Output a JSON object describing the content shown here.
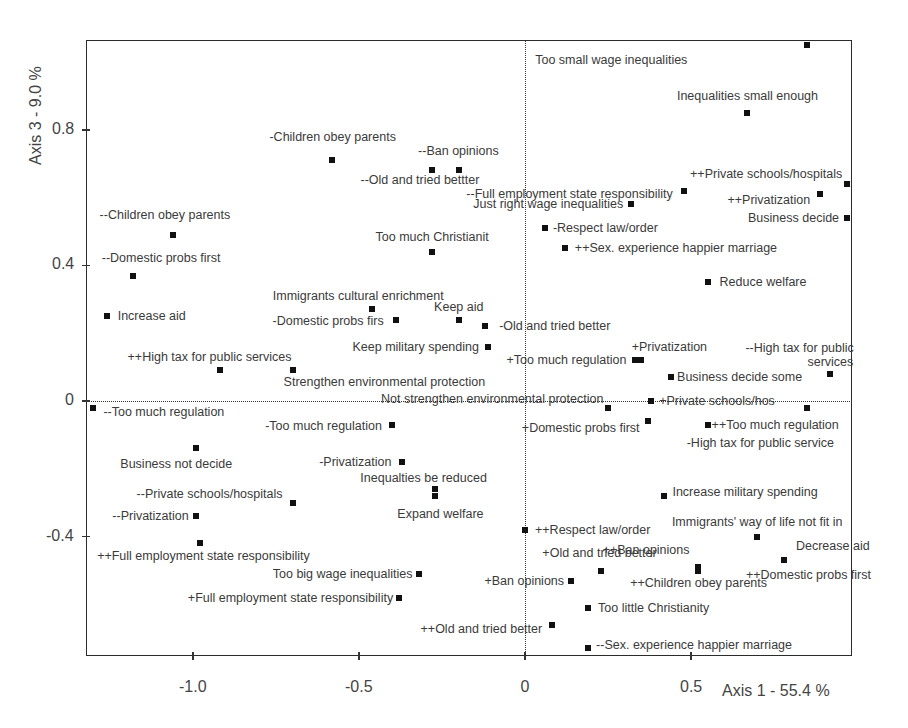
{
  "chart_data": {
    "type": "scatter",
    "title": "",
    "xlabel": "Axis 1  -  55.4 %",
    "ylabel": "Axis 3  -  9.0 %",
    "xlim": [
      -1.31,
      0.99
    ],
    "ylim": [
      -0.75,
      1.07
    ],
    "xticks": [
      -1.0,
      -0.5,
      0,
      0.5
    ],
    "xtick_labels": [
      "-1.0",
      "-0.5",
      "0",
      "0.5"
    ],
    "yticks": [
      -0.4,
      0,
      0.4,
      0.8
    ],
    "ytick_labels": [
      "-0.4",
      "0",
      "0.4",
      "0.8"
    ],
    "grid": false,
    "reference_lines": {
      "x": 0,
      "y": 0,
      "style": "dotted"
    },
    "marker": "square",
    "legend": null,
    "points": [
      {
        "label": "Too small wage inequalities",
        "x": 0.85,
        "y": 1.05,
        "lx": -120,
        "ly": 8,
        "anchor": "right"
      },
      {
        "label": "Inequalities small enough",
        "x": 0.67,
        "y": 0.85,
        "lx": 0,
        "ly": -24,
        "anchor": "center"
      },
      {
        "label": "-Children obey parents",
        "x": -0.58,
        "y": 0.71,
        "lx": 0,
        "ly": -30,
        "anchor": "center"
      },
      {
        "label": "--Old and tried bettter",
        "x": -0.28,
        "y": 0.68,
        "lx": -12,
        "ly": 3,
        "anchor": "center"
      },
      {
        "label": "--Ban opinions",
        "x": -0.2,
        "y": 0.68,
        "lx": 0,
        "ly": -26,
        "anchor": "center"
      },
      {
        "label": "--Full employment state responsibility",
        "x": 0.48,
        "y": 0.62,
        "lx": -12,
        "ly": -4,
        "anchor": "right"
      },
      {
        "label": "++Private schools/hospitals",
        "x": 0.97,
        "y": 0.64,
        "lx": -5,
        "ly": -17,
        "anchor": "right"
      },
      {
        "label": "++Privatization",
        "x": 0.89,
        "y": 0.61,
        "lx": -10,
        "ly": -1,
        "anchor": "right"
      },
      {
        "label": "Just right wage inequalities",
        "x": 0.32,
        "y": 0.58,
        "lx": -8,
        "ly": -7,
        "anchor": "right"
      },
      {
        "label": "Business decide",
        "x": 0.97,
        "y": 0.54,
        "lx": -8,
        "ly": -7,
        "anchor": "right"
      },
      {
        "label": "-Respect law/order",
        "x": 0.06,
        "y": 0.51,
        "lx": 8,
        "ly": -7,
        "anchor": "left"
      },
      {
        "label": "--Children obey parents",
        "x": -1.06,
        "y": 0.49,
        "lx": -8,
        "ly": -27,
        "anchor": "center"
      },
      {
        "label": "++Sex. experience happier marriage",
        "x": 0.12,
        "y": 0.45,
        "lx": 10,
        "ly": -7,
        "anchor": "left"
      },
      {
        "label": "Too much Christianit",
        "x": -0.28,
        "y": 0.44,
        "lx": 0,
        "ly": -22,
        "anchor": "center"
      },
      {
        "label": "--Domestic probs first",
        "x": -1.18,
        "y": 0.37,
        "lx": 28,
        "ly": -25,
        "anchor": "center"
      },
      {
        "label": "Reduce welfare",
        "x": 0.55,
        "y": 0.35,
        "lx": 12,
        "ly": -7,
        "anchor": "left"
      },
      {
        "label": "Increase aid",
        "x": -1.26,
        "y": 0.25,
        "lx": 11,
        "ly": -7,
        "anchor": "left"
      },
      {
        "label": "Immigrants cultural enrichment",
        "x": -0.46,
        "y": 0.27,
        "lx": -14,
        "ly": -20,
        "anchor": "center"
      },
      {
        "label": "-Domestic probs firs",
        "x": -0.39,
        "y": 0.24,
        "lx": -12,
        "ly": -6,
        "anchor": "right"
      },
      {
        "label": "Keep aid",
        "x": -0.2,
        "y": 0.24,
        "lx": 0,
        "ly": -20,
        "anchor": "center"
      },
      {
        "label": "-Old and tried better",
        "x": -0.12,
        "y": 0.22,
        "lx": 14,
        "ly": -7,
        "anchor": "left"
      },
      {
        "label": "Keep military spending",
        "x": -0.11,
        "y": 0.16,
        "lx": -10,
        "ly": -7,
        "anchor": "right"
      },
      {
        "label": "++High tax for public services",
        "x": -0.92,
        "y": 0.09,
        "lx": -10,
        "ly": -20,
        "anchor": "center"
      },
      {
        "label": "Strengthen environmental protection",
        "x": -0.7,
        "y": 0.09,
        "lx": 92,
        "ly": 5,
        "anchor": "center"
      },
      {
        "label": "+Too much regulation",
        "x": 0.33,
        "y": 0.12,
        "lx": -8,
        "ly": -7,
        "anchor": "right"
      },
      {
        "label": "+Privatization",
        "x": 0.35,
        "y": 0.12,
        "lx": 28,
        "ly": -20,
        "anchor": "center"
      },
      {
        "label": "Business decide some",
        "x": 0.44,
        "y": 0.07,
        "lx": 6,
        "ly": -7,
        "anchor": "left"
      },
      {
        "label": "--High tax for public",
        "x": 0.92,
        "y": 0.08,
        "lx": 23,
        "ly": -33,
        "anchor": "right"
      },
      {
        "label": "services",
        "x": 0.92,
        "y": 0.08,
        "lx": 23,
        "ly": -19,
        "anchor": "right",
        "no_marker": true
      },
      {
        "label": "Not strengthen environmental protection",
        "x": 0.25,
        "y": -0.02,
        "lx": -5,
        "ly": -16,
        "anchor": "right"
      },
      {
        "label": "+Private schools/hos",
        "x": 0.38,
        "y": 0.0,
        "lx": 8,
        "ly": -7,
        "anchor": "left"
      },
      {
        "label": "-High tax for public service",
        "x": 0.85,
        "y": -0.02,
        "lx": -47,
        "ly": 28,
        "anchor": "center"
      },
      {
        "label": "--Too much regulation",
        "x": -1.3,
        "y": -0.02,
        "lx": 10,
        "ly": -3,
        "anchor": "left"
      },
      {
        "label": "+Domestic probs first",
        "x": 0.37,
        "y": -0.06,
        "lx": -8,
        "ly": 0,
        "anchor": "right"
      },
      {
        "label": "++Too much regulation",
        "x": 0.55,
        "y": -0.07,
        "lx": 4,
        "ly": -7,
        "anchor": "left"
      },
      {
        "label": "-Too much regulation",
        "x": -0.4,
        "y": -0.07,
        "lx": -10,
        "ly": -6,
        "anchor": "right"
      },
      {
        "label": "Business not decide",
        "x": -0.99,
        "y": -0.14,
        "lx": -20,
        "ly": 9,
        "anchor": "center"
      },
      {
        "label": "-Privatization",
        "x": -0.37,
        "y": -0.18,
        "lx": -11,
        "ly": -7,
        "anchor": "right"
      },
      {
        "label": "Inequalties be reduced",
        "x": -0.27,
        "y": -0.26,
        "lx": -12,
        "ly": -18,
        "anchor": "center"
      },
      {
        "label": "Expand welfare",
        "x": -0.27,
        "y": -0.28,
        "lx": 5,
        "ly": 11,
        "anchor": "center"
      },
      {
        "label": "Increase military spending",
        "x": 0.42,
        "y": -0.28,
        "lx": 8,
        "ly": -11,
        "anchor": "left"
      },
      {
        "label": "--Private schools/hospitals",
        "x": -0.7,
        "y": -0.3,
        "lx": -10,
        "ly": -16,
        "anchor": "right"
      },
      {
        "label": "--Privatization",
        "x": -0.99,
        "y": -0.34,
        "lx": -8,
        "ly": -7,
        "anchor": "right"
      },
      {
        "label": "++Respect law/order",
        "x": 0.0,
        "y": -0.38,
        "lx": 10,
        "ly": -7,
        "anchor": "left"
      },
      {
        "label": "Immigrants' way of life not fit in",
        "x": 0.7,
        "y": -0.4,
        "lx": 0,
        "ly": -22,
        "anchor": "center"
      },
      {
        "label": "++Full employment state responsibility",
        "x": -0.98,
        "y": -0.42,
        "lx": 4,
        "ly": 6,
        "anchor": "center"
      },
      {
        "label": "Decrease aid",
        "x": 0.78,
        "y": -0.47,
        "lx": 12,
        "ly": -21,
        "anchor": "left"
      },
      {
        "label": "++Domestic probs first",
        "x": 0.78,
        "y": -0.47,
        "lx": -38,
        "ly": 8,
        "anchor": "left"
      },
      {
        "label": "++Ban opinions",
        "x": 0.52,
        "y": -0.49,
        "lx": -8,
        "ly": -24,
        "anchor": "right"
      },
      {
        "label": "++Children obey parents",
        "x": 0.52,
        "y": -0.5,
        "lx": 1,
        "ly": 5,
        "anchor": "center"
      },
      {
        "label": "+Old and tried better",
        "x": 0.23,
        "y": -0.5,
        "lx": -2,
        "ly": -25,
        "anchor": "center"
      },
      {
        "label": "Too big wage inequalities",
        "x": -0.32,
        "y": -0.51,
        "lx": -6,
        "ly": -7,
        "anchor": "right"
      },
      {
        "label": "+Ban opinions",
        "x": 0.14,
        "y": -0.53,
        "lx": -7,
        "ly": -7,
        "anchor": "right"
      },
      {
        "label": "+Full employment state responsibility",
        "x": -0.38,
        "y": -0.58,
        "lx": -6,
        "ly": -7,
        "anchor": "right"
      },
      {
        "label": "Too little Christianity",
        "x": 0.19,
        "y": -0.61,
        "lx": 10,
        "ly": -7,
        "anchor": "left"
      },
      {
        "label": "++Old and tried better",
        "x": 0.08,
        "y": -0.66,
        "lx": -9,
        "ly": -3,
        "anchor": "right"
      },
      {
        "label": "--Sex. experience happier marriage",
        "x": 0.19,
        "y": -0.73,
        "lx": 8,
        "ly": -10,
        "anchor": "left"
      }
    ]
  },
  "layout": {
    "frame": {
      "left": 86,
      "top": 40,
      "right": 852,
      "bottom": 656
    },
    "x_origin_px": 525,
    "x_px_per_unit": 332,
    "y_origin_px": 401,
    "y_px_per_unit": 339
  },
  "axes": {
    "x_title": "Axis 1  -  55.4 %",
    "y_title": "Axis 3  -  9.0 %"
  }
}
